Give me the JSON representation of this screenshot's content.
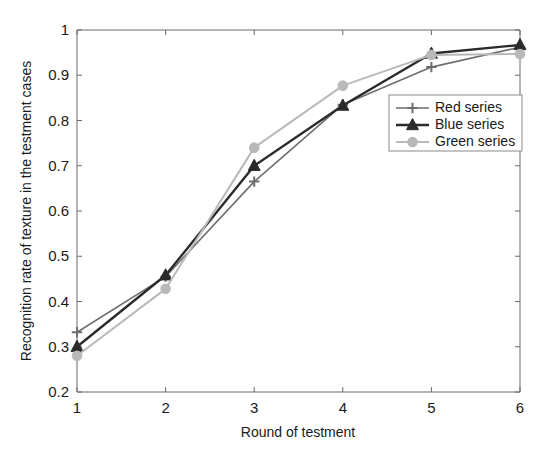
{
  "chart_data": {
    "type": "line",
    "title": "",
    "xlabel": "Round of testment",
    "ylabel": "Recognition rate of texture in the testment cases",
    "x": [
      1,
      2,
      3,
      4,
      5,
      6
    ],
    "categories": [
      "1",
      "2",
      "3",
      "4",
      "5",
      "6"
    ],
    "xtick_labels": [
      "1",
      "2",
      "3",
      "4",
      "5",
      "6"
    ],
    "ytick_labels": [
      "0.2",
      "0.3",
      "0.4",
      "0.5",
      "0.6",
      "0.7",
      "0.8",
      "0.9",
      "1"
    ],
    "ytick_values": [
      0.2,
      0.3,
      0.4,
      0.5,
      0.6,
      0.7,
      0.8,
      0.9,
      1
    ],
    "xlim": [
      1,
      6
    ],
    "ylim": [
      0.2,
      1.0
    ],
    "grid": false,
    "legend_position": "right",
    "series": [
      {
        "name": "Red series",
        "label": "Red series",
        "color": "#6e6e6e",
        "marker": "plus",
        "line_width": 1.6,
        "values": [
          0.332,
          0.455,
          0.665,
          0.835,
          0.918,
          0.962
        ]
      },
      {
        "name": "Blue series",
        "label": "Blue series",
        "color": "#2b2b2b",
        "marker": "triangle",
        "line_width": 2.4,
        "values": [
          0.3,
          0.458,
          0.7,
          0.833,
          0.948,
          0.967
        ]
      },
      {
        "name": "Green series",
        "label": "Green series",
        "color": "#b9b9b9",
        "marker": "circle",
        "line_width": 2.0,
        "values": [
          0.28,
          0.428,
          0.74,
          0.877,
          0.945,
          0.947
        ]
      }
    ]
  },
  "legend": {
    "items": [
      {
        "label": "Red series"
      },
      {
        "label": "Blue series"
      },
      {
        "label": "Green series"
      }
    ]
  },
  "axes": {
    "x_title": "Round of testment",
    "y_title": "Recognition rate of texture in the testment cases"
  }
}
